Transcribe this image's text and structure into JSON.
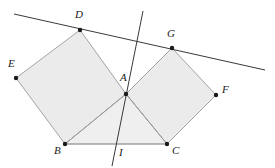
{
  "figure": {
    "background_color": "#ffffff",
    "width": 275,
    "height": 168
  },
  "style": {
    "polygon_fill": "#ebebeb",
    "triangle_fill": "#efefef",
    "polygon_stroke": "#9a9a9a",
    "line_stroke": "#3a3a3a",
    "point_color": "#1a1a1a",
    "label_color": "#1a1a1a",
    "point_radius": 2.2,
    "polygon_stroke_width": 0.9,
    "line_stroke_width": 1.0
  },
  "points": [
    {
      "id": "A",
      "label": "A",
      "x": 126,
      "y": 94,
      "label_x": 120,
      "label_y": 72
    },
    {
      "id": "B",
      "label": "B",
      "x": 65,
      "y": 144,
      "label_x": 54,
      "label_y": 145
    },
    {
      "id": "C",
      "label": "C",
      "x": 167,
      "y": 144,
      "label_x": 172,
      "label_y": 145
    },
    {
      "id": "D",
      "label": "D",
      "x": 80,
      "y": 30,
      "label_x": 75,
      "label_y": 9
    },
    {
      "id": "E",
      "label": "E",
      "x": 16,
      "y": 78,
      "label_x": 8,
      "label_y": 58
    },
    {
      "id": "F",
      "label": "F",
      "x": 216,
      "y": 95,
      "label_x": 222,
      "label_y": 84
    },
    {
      "id": "G",
      "label": "G",
      "x": 172,
      "y": 48,
      "label_x": 167,
      "label_y": 28
    },
    {
      "id": "I",
      "label": "I",
      "x": 117,
      "y": 155,
      "label_x": 119,
      "label_y": 147
    }
  ],
  "polygons": [
    {
      "id": "square-EDAB",
      "name": "left-square",
      "vertices": "E,D,A,B",
      "path": "16,78 80,30 126,94 65,144",
      "fill": "#ebebeb"
    },
    {
      "id": "square-AGFC",
      "name": "right-square",
      "vertices": "A,G,F,C",
      "path": "126,94 172,48 216,95 167,144",
      "fill": "#ebebeb"
    },
    {
      "id": "triangle-ABC",
      "name": "base-triangle",
      "vertices": "A,B,C",
      "path": "126,94 65,144 167,144",
      "fill": "#efefef"
    }
  ],
  "lines": [
    {
      "id": "line-DG",
      "name": "tangent-line-through-D-and-G",
      "x1": 14,
      "y1": 14,
      "x2": 265,
      "y2": 70
    },
    {
      "id": "line-AI",
      "name": "cevian-line-through-A-and-I",
      "x1": 143,
      "y1": 11,
      "x2": 112,
      "y2": 166
    }
  ],
  "segments": [
    {
      "id": "seg-BC",
      "name": "segment-BC",
      "x1": 65,
      "y1": 144,
      "x2": 167,
      "y2": 144
    },
    {
      "id": "seg-AB",
      "name": "segment-AB",
      "x1": 126,
      "y1": 94,
      "x2": 65,
      "y2": 144
    },
    {
      "id": "seg-AC",
      "name": "segment-AC",
      "x1": 126,
      "y1": 94,
      "x2": 167,
      "y2": 144
    }
  ]
}
